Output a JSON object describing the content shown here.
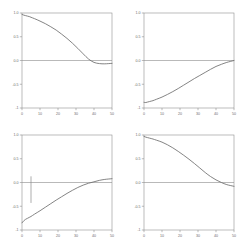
{
  "figure": {
    "background_color": "#ffffff",
    "axis_color": "#8f8f8f",
    "curve_color": "#6e6e6e",
    "layout": "2x2 grid of line plots"
  },
  "chart_data": [
    {
      "panel": "top-left",
      "type": "line",
      "title": "",
      "xlabel": "",
      "ylabel": "",
      "xlim": [
        0,
        50
      ],
      "ylim": [
        -1,
        1
      ],
      "xticks": [
        0,
        10,
        20,
        30,
        40,
        50
      ],
      "xticklabels": [
        "0",
        "10",
        "20",
        "30",
        "40",
        "50"
      ],
      "yticks": [
        1.0,
        0.5,
        0.0,
        -0.5,
        -1.0
      ],
      "yticklabels": [
        "1.0",
        "0.5",
        "0.0",
        "-0.5",
        "-1"
      ],
      "grid": false,
      "legend": "none",
      "reference_line_y": 0.0,
      "x": [
        0,
        1,
        2,
        3,
        4,
        5,
        7,
        10,
        13,
        16,
        19,
        22,
        25,
        28,
        31,
        34,
        37,
        40,
        43,
        46,
        50
      ],
      "y": [
        0.97,
        0.955,
        0.945,
        0.935,
        0.925,
        0.91,
        0.88,
        0.83,
        0.775,
        0.71,
        0.64,
        0.555,
        0.465,
        0.365,
        0.255,
        0.14,
        0.03,
        -0.04,
        -0.065,
        -0.07,
        -0.06
      ]
    },
    {
      "panel": "top-right",
      "type": "line",
      "title": "",
      "xlabel": "",
      "ylabel": "",
      "xlim": [
        0,
        50
      ],
      "ylim": [
        -1,
        1
      ],
      "xticks": [
        0,
        10,
        20,
        30,
        40,
        50
      ],
      "xticklabels": [
        "0",
        "10",
        "20",
        "30",
        "40",
        "50"
      ],
      "yticks": [
        1.0,
        0.5,
        0.0,
        -0.5,
        -1.0
      ],
      "yticklabels": [
        "1.0",
        "0.5",
        "0.0",
        "-0.5",
        "-1"
      ],
      "grid": false,
      "legend": "none",
      "reference_line_y": 0.0,
      "x": [
        0,
        1,
        2,
        3,
        4,
        5,
        7,
        10,
        13,
        16,
        19,
        22,
        25,
        28,
        31,
        34,
        37,
        40,
        43,
        46,
        50
      ],
      "y": [
        -0.88,
        -0.885,
        -0.875,
        -0.865,
        -0.855,
        -0.845,
        -0.815,
        -0.77,
        -0.715,
        -0.655,
        -0.59,
        -0.52,
        -0.45,
        -0.38,
        -0.315,
        -0.25,
        -0.185,
        -0.125,
        -0.08,
        -0.04,
        0.0
      ]
    },
    {
      "panel": "bottom-left",
      "type": "line",
      "title": "",
      "xlabel": "",
      "ylabel": "",
      "xlim": [
        0,
        50
      ],
      "ylim": [
        -1,
        1
      ],
      "xticks": [
        0,
        10,
        20,
        30,
        40,
        50
      ],
      "xticklabels": [
        "0",
        "10",
        "20",
        "30",
        "40",
        "50"
      ],
      "yticks": [
        1.0,
        0.5,
        0.0,
        -0.5,
        -1.0
      ],
      "yticklabels": [
        "1.0",
        "0.5",
        "0.0",
        "-0.5",
        "-1"
      ],
      "grid": false,
      "legend": "none",
      "reference_line_y": 0.0,
      "error_bar": {
        "x": 5,
        "y_low": -0.43,
        "y_high": 0.13
      },
      "x": [
        0,
        1,
        2,
        3,
        4,
        5,
        7,
        10,
        13,
        16,
        19,
        22,
        25,
        28,
        31,
        34,
        37,
        40,
        43,
        46,
        50
      ],
      "y": [
        -0.85,
        -0.805,
        -0.775,
        -0.755,
        -0.735,
        -0.715,
        -0.665,
        -0.595,
        -0.52,
        -0.445,
        -0.37,
        -0.3,
        -0.23,
        -0.165,
        -0.105,
        -0.055,
        -0.015,
        0.015,
        0.045,
        0.065,
        0.08
      ]
    },
    {
      "panel": "bottom-right",
      "type": "line",
      "title": "",
      "xlabel": "",
      "ylabel": "",
      "xlim": [
        0,
        50
      ],
      "ylim": [
        -1,
        1
      ],
      "xticks": [
        0,
        10,
        20,
        30,
        40,
        50
      ],
      "xticklabels": [
        "0",
        "10",
        "20",
        "30",
        "40",
        "50"
      ],
      "yticks": [
        1.0,
        0.5,
        0.0,
        -0.5,
        -1.0
      ],
      "yticklabels": [
        "1.0",
        "0.5",
        "0.0",
        "-0.5",
        "-1"
      ],
      "grid": false,
      "legend": "none",
      "reference_line_y": 0.0,
      "x": [
        0,
        1,
        2,
        3,
        4,
        5,
        7,
        10,
        13,
        16,
        19,
        22,
        25,
        28,
        31,
        34,
        37,
        40,
        43,
        46,
        50
      ],
      "y": [
        0.97,
        0.955,
        0.945,
        0.935,
        0.925,
        0.915,
        0.89,
        0.85,
        0.795,
        0.73,
        0.655,
        0.575,
        0.49,
        0.4,
        0.305,
        0.21,
        0.125,
        0.055,
        0.0,
        -0.045,
        -0.08
      ]
    }
  ]
}
